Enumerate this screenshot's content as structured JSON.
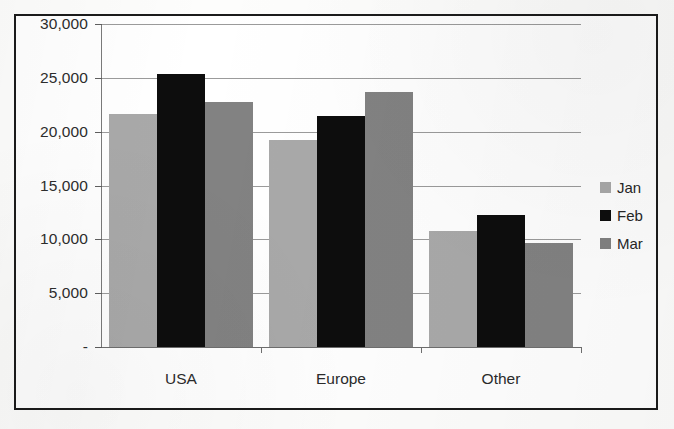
{
  "chart_data": {
    "type": "bar",
    "title": "",
    "subtitle": "",
    "xlabel": "",
    "ylabel": "",
    "categories": [
      "USA",
      "Europe",
      "Other"
    ],
    "series": [
      {
        "name": "Jan",
        "color": "#a9a9a9",
        "values": [
          21600,
          19200,
          10800
        ]
      },
      {
        "name": "Feb",
        "color": "#0d0d0d",
        "values": [
          25400,
          21500,
          12300
        ]
      },
      {
        "name": "Mar",
        "color": "#828282",
        "values": [
          22800,
          23700,
          9700
        ]
      }
    ],
    "ylim": [
      0,
      30000
    ],
    "ytick_values": [
      0,
      5000,
      10000,
      15000,
      20000,
      25000,
      30000
    ],
    "ytick_labels": [
      "-",
      "5,000",
      "10,000",
      "15,000",
      "20,000",
      "25,000",
      "30,000"
    ],
    "grid": true,
    "legend_position": "right"
  },
  "legend": {
    "entries": [
      {
        "label": "Jan",
        "swatch": "jan"
      },
      {
        "label": "Feb",
        "swatch": "feb"
      },
      {
        "label": "Mar",
        "swatch": "mar"
      }
    ]
  },
  "frame": {
    "border_color": "#1b1b1b",
    "background": "#ffffff"
  }
}
